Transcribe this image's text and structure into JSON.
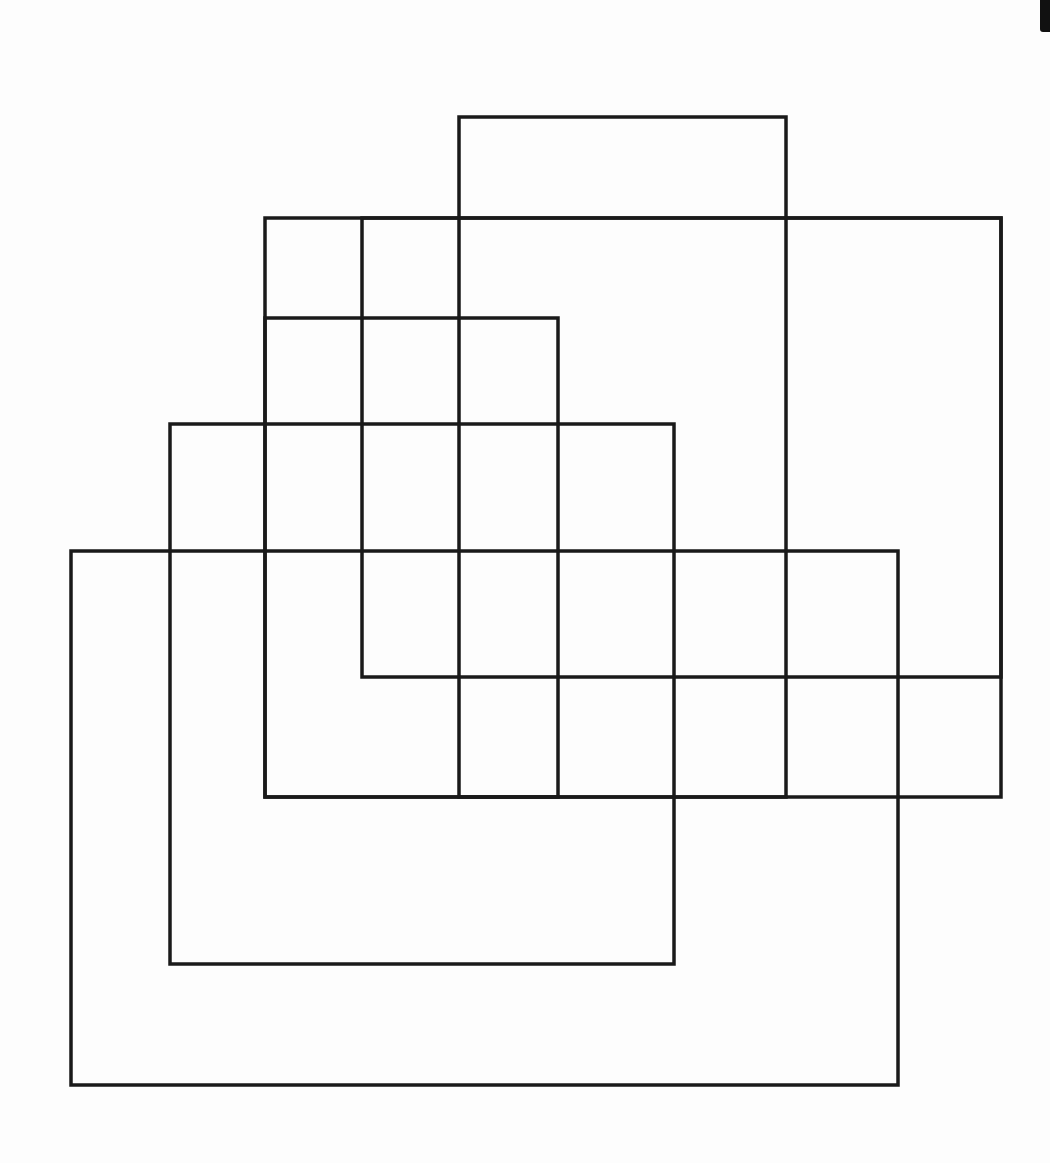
{
  "diagram": {
    "stroke_color": "#1a1a1a",
    "stroke_width": 3.5,
    "background": "#ffffff",
    "rectangles": [
      {
        "id": "rect-top-tall",
        "x": 459,
        "y": 117,
        "w": 327,
        "h": 680
      },
      {
        "id": "rect-big-right",
        "x": 265,
        "y": 218,
        "w": 736,
        "h": 579
      },
      {
        "id": "rect-upper-left-square",
        "x": 265,
        "y": 318,
        "w": 293,
        "h": 479
      },
      {
        "id": "rect-middle",
        "x": 170,
        "y": 424,
        "w": 504,
        "h": 540
      },
      {
        "id": "rect-bottom-large",
        "x": 71,
        "y": 551,
        "w": 827,
        "h": 534
      },
      {
        "id": "rect-inner",
        "x": 362,
        "y": 218,
        "w": 639,
        "h": 459
      }
    ],
    "scan_edge_color": "#111111"
  }
}
